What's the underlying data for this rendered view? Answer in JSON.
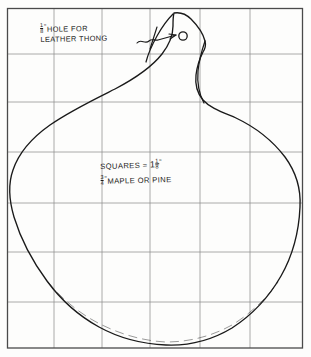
{
  "drawing": {
    "title": "Hand-drawn woodworking pattern on graph paper",
    "medium": "pencil on graph paper",
    "background_color": "#fdfdfc",
    "grid_color": "#8f8f8f",
    "ink_color": "#1a1a1a"
  },
  "annotations": {
    "hole_note": {
      "fraction_numerator": "1",
      "fraction_denominator": "8",
      "inch_mark": "”",
      "line1": "HOLE FOR",
      "line2": "LEATHER THONG",
      "full_text": "1/8” HOLE FOR LEATHER THONG"
    },
    "material_note": {
      "line1_prefix": "SQUARES =",
      "line1_whole": "1",
      "line1_numerator": "1",
      "line1_denominator": "8",
      "line1_inch": "”",
      "line1_full": "SQUARES = 1 1/8”",
      "line2_numerator": "3",
      "line2_denominator": "4",
      "line2_inch": "”",
      "line2_text": "MAPLE OR PINE",
      "line2_full": "3/4” MAPLE OR PINE"
    }
  },
  "grid": {
    "columns": 6,
    "rows": 7,
    "x_lines": [
      7,
      54,
      102,
      150,
      200,
      250,
      303
    ],
    "y_lines": [
      8,
      54,
      102,
      152,
      203,
      252,
      302,
      348
    ],
    "square_size_label": "1 1/8 inch"
  },
  "features": {
    "hole": {
      "name": "leather thong hole",
      "cx": 183,
      "cy": 36,
      "r": 4.2,
      "diameter_label": "1/8”"
    },
    "leader": {
      "name": "arrow leader line to hole",
      "from_x": 139,
      "from_y": 41,
      "to_x": 176,
      "to_y": 35
    },
    "outline": {
      "name": "gourd shaped board outline",
      "leftmost_x": 10,
      "rightmost_x": 300,
      "top_y": 13,
      "bottom_y": 345
    }
  },
  "colors": {
    "ink": "#1a1a1a",
    "grid": "#8f8f8f",
    "paper": "#fdfdfc",
    "border": "#555555"
  }
}
